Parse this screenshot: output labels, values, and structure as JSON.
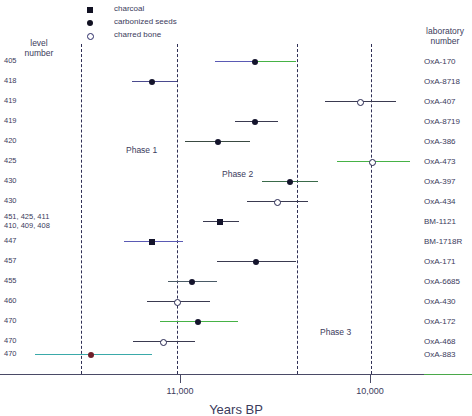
{
  "headers": {
    "level_column": "level\nnumber",
    "lab_column": "laboratory\nnumber"
  },
  "legend": {
    "items": [
      {
        "symbol": "filled-square",
        "label": "charcoal"
      },
      {
        "symbol": "filled-circle",
        "label": "carbonized seeds"
      },
      {
        "symbol": "open-circle",
        "label": "charred bone"
      }
    ]
  },
  "axis": {
    "title": "Years BP",
    "ticks": [
      {
        "label": "11,000",
        "x": 180
      },
      {
        "label": "10,000",
        "x": 370
      }
    ],
    "direction": "decreasing-right"
  },
  "phases": [
    {
      "label": "Phase 1",
      "x": 126,
      "y": 145
    },
    {
      "label": "Phase 2",
      "x": 222,
      "y": 169
    },
    {
      "label": "Phase 3",
      "x": 320,
      "y": 327
    }
  ],
  "phase_dividers": [
    81,
    177,
    297,
    371
  ],
  "colors": {
    "point": "#14142c",
    "open_point_edge": "#24244f",
    "bar_dark": "#3a3a50",
    "bar_blue": "#5a5ab4",
    "bar_green": "#46b246",
    "bar_teal": "#3aa9a9",
    "point_red": "#6e1f2a",
    "text": "#3b3b5c",
    "axis": "#4a4a66",
    "divider": "#2f2f55"
  },
  "chart_data": {
    "type": "scatter",
    "title": "",
    "xlabel": "Years BP",
    "ylabel": "",
    "xlim": [
      11600,
      9650
    ],
    "grid": false,
    "legend_position": "top",
    "categories": [
      "405",
      "418",
      "419",
      "419",
      "420",
      "425",
      "430",
      "430",
      "451, 425, 411\n410, 409, 408",
      "447",
      "457",
      "455",
      "460",
      "470",
      "470",
      "470"
    ],
    "rows": [
      {
        "level": "405",
        "lab": "OxA-170",
        "sample": "carbonized seeds",
        "pt_x": 255,
        "bar_x1": 215,
        "bar_x2": 296,
        "y": 61,
        "bar_color": "#5a5ab4",
        "bar_color2": "#46b246",
        "bar_split": 258,
        "pt_color": "#14142c"
      },
      {
        "level": "418",
        "lab": "OxA-8718",
        "sample": "carbonized seeds",
        "pt_x": 152,
        "bar_x1": 132,
        "bar_x2": 177,
        "y": 81,
        "bar_color": "#4a4a8e",
        "pt_color": "#14142c"
      },
      {
        "level": "419",
        "lab": "OxA-407",
        "sample": "charred bone",
        "pt_x": 360,
        "bar_x1": 325,
        "bar_x2": 396,
        "y": 101,
        "bar_color": "#3a3a50",
        "pt_color": "#ffffff"
      },
      {
        "level": "419",
        "lab": "OxA-8719",
        "sample": "carbonized seeds",
        "pt_x": 255,
        "bar_x1": 235,
        "bar_x2": 278,
        "y": 121,
        "bar_color": "#3a3a50",
        "pt_color": "#14142c"
      },
      {
        "level": "420",
        "lab": "OxA-386",
        "sample": "carbonized seeds",
        "pt_x": 218,
        "bar_x1": 185,
        "bar_x2": 250,
        "y": 141,
        "bar_color": "#3a4a42",
        "pt_color": "#14142c"
      },
      {
        "level": "425",
        "lab": "OxA-473",
        "sample": "charred bone",
        "pt_x": 372,
        "bar_x1": 337,
        "bar_x2": 410,
        "y": 161,
        "bar_color": "#46b246",
        "pt_color": "#ffffff"
      },
      {
        "level": "430",
        "lab": "OxA-397",
        "sample": "carbonized seeds",
        "pt_x": 290,
        "bar_x1": 262,
        "bar_x2": 318,
        "y": 181,
        "bar_color": "#3a6a4a",
        "pt_color": "#14142c"
      },
      {
        "level": "430",
        "lab": "OxA-434",
        "sample": "charred bone",
        "pt_x": 277,
        "bar_x1": 247,
        "bar_x2": 308,
        "y": 201,
        "bar_color": "#3a3a50",
        "pt_color": "#ffffff"
      },
      {
        "level": "451, 425, 411\n410, 409, 408",
        "lab": "BM-1121",
        "sample": "charcoal",
        "pt_x": 220,
        "bar_x1": 203,
        "bar_x2": 239,
        "y": 221,
        "bar_color": "#3a3a50",
        "pt_color": "#14142c"
      },
      {
        "level": "447",
        "lab": "BM-1718R",
        "sample": "charcoal",
        "pt_x": 152,
        "bar_x1": 124,
        "bar_x2": 183,
        "y": 241,
        "bar_color": "#5a5ab4",
        "pt_color": "#14142c"
      },
      {
        "level": "457",
        "lab": "OxA-171",
        "sample": "carbonized seeds",
        "pt_x": 256,
        "bar_x1": 217,
        "bar_x2": 296,
        "y": 261,
        "bar_color": "#3a3a50",
        "pt_color": "#14142c"
      },
      {
        "level": "455",
        "lab": "OxA-6685",
        "sample": "carbonized seeds",
        "pt_x": 192,
        "bar_x1": 168,
        "bar_x2": 217,
        "y": 281,
        "bar_color": "#4a5a66",
        "pt_color": "#14142c"
      },
      {
        "level": "460",
        "lab": "OxA-430",
        "sample": "charred bone",
        "pt_x": 177,
        "bar_x1": 147,
        "bar_x2": 210,
        "y": 301,
        "bar_color": "#3a3a50",
        "pt_color": "#ffffff"
      },
      {
        "level": "470",
        "lab": "OxA-172",
        "sample": "carbonized seeds",
        "pt_x": 198,
        "bar_x1": 160,
        "bar_x2": 238,
        "y": 321,
        "bar_color": "#46b246",
        "pt_color": "#14142c"
      },
      {
        "level": "470",
        "lab": "OxA-468",
        "sample": "charred bone",
        "pt_x": 163,
        "bar_x1": 133,
        "bar_x2": 195,
        "y": 341,
        "bar_color": "#3a3a50",
        "pt_color": "#ffffff"
      },
      {
        "level": "470",
        "lab": "OxA-883",
        "sample": "carbonized seeds",
        "pt_x": 91,
        "bar_x1": 35,
        "bar_x2": 152,
        "y": 354,
        "bar_color": "#3aa9a9",
        "pt_color": "#6e1f2a"
      }
    ]
  }
}
